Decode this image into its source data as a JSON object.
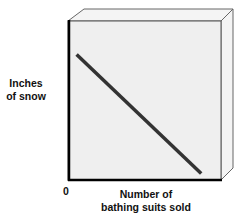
{
  "chart_data": {
    "type": "line",
    "title": "",
    "xlabel": "Number of bathing suits sold",
    "ylabel": "Inches of snow",
    "xlabel_lines": [
      "Number of",
      "bathing suits sold"
    ],
    "ylabel_lines": [
      "Inches",
      "of snow"
    ],
    "origin_label": "0",
    "x_ticks": [
      "0"
    ],
    "y_ticks": [],
    "grid": false,
    "legend": null,
    "style": "3d-box",
    "series": [
      {
        "name": "relationship",
        "description": "negative linear relationship",
        "x": [
          0.05,
          0.87
        ],
        "y": [
          0.79,
          0.04
        ],
        "color": "#333333"
      }
    ],
    "xlim": [
      0,
      1
    ],
    "ylim": [
      0,
      1
    ]
  },
  "colors": {
    "front_face": "#efefef",
    "side_face": "#f4f4f4",
    "top_face": "#f4f4f4",
    "axis": "#000000",
    "edge": "#555555",
    "line": "#333333"
  }
}
